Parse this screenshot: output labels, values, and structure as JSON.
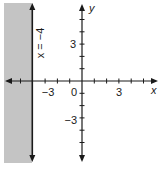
{
  "graph": {
    "boundary_label": "x = −4",
    "boundary_x": -4,
    "shaded_side": "left",
    "shade_color": "#c4c4c4",
    "axis_color": "#1a1a1a",
    "x_axis_label": "x",
    "y_axis_label": "y",
    "x_tick_labels": [
      {
        "value": -3,
        "text": "−3"
      },
      {
        "value": 0,
        "text": "0"
      },
      {
        "value": 3,
        "text": "3"
      }
    ],
    "y_tick_labels": [
      {
        "value": 3,
        "text": "3"
      },
      {
        "value": -3,
        "text": "−3"
      }
    ],
    "x_range": [
      -6,
      6
    ],
    "y_range": [
      -6,
      6
    ],
    "tick_interval": 1
  }
}
